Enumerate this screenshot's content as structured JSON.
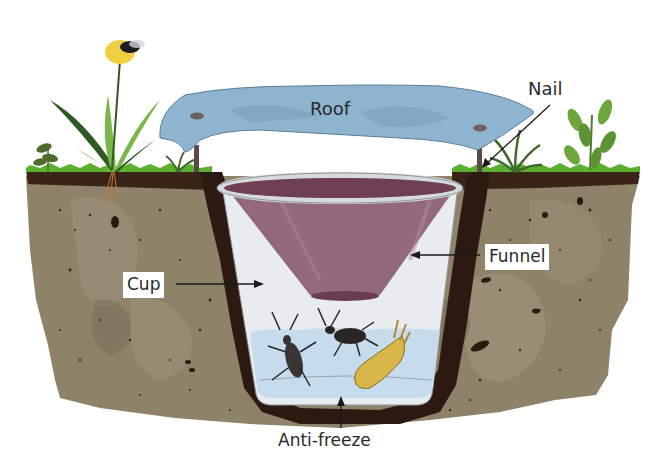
{
  "diagram": {
    "type": "pitfall-trap-illustration",
    "labels": {
      "roof": "Roof",
      "nail": "Nail",
      "cup": "Cup",
      "funnel": "Funnel",
      "antifreeze": "Anti-freeze"
    },
    "components": [
      {
        "id": "roof",
        "label": "Roof",
        "description": "Blue cover sheet held above the trap"
      },
      {
        "id": "nail",
        "label": "Nail",
        "description": "Nails pinning the roof above the ground"
      },
      {
        "id": "cup",
        "label": "Cup",
        "description": "Clear cup buried flush with soil surface"
      },
      {
        "id": "funnel",
        "label": "Funnel",
        "description": "Purple funnel inserted in cup mouth"
      },
      {
        "id": "antifreeze",
        "label": "Anti-freeze",
        "description": "Preserving liquid at the cup bottom containing caught insects"
      }
    ],
    "colors": {
      "soil": "#8e8268",
      "soil_dark": "#3a2418",
      "grass": "#5cb030",
      "roof": "#8fb4cf",
      "roof_outline": "#5c7e96",
      "funnel": "#8a5a6e",
      "cup": "#e8ecef",
      "liquid": "#c6dcec",
      "flower": "#f0d040",
      "leaf_dark": "#2f5a23",
      "leaf_light": "#7ab648",
      "label_text": "#2a2a2a"
    }
  }
}
